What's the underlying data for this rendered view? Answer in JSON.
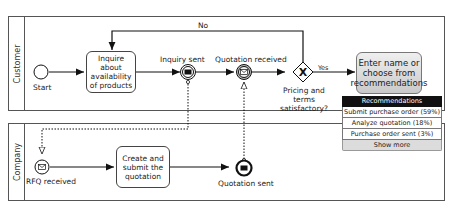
{
  "pools": {
    "customer": {
      "label": "Customer"
    },
    "company": {
      "label": "Company"
    }
  },
  "customer": {
    "start_label": "Start",
    "task_inquire": "Inquire about availability of products",
    "event_inquiry_sent": "Inquiry sent",
    "event_quotation_received": "Quotation received",
    "gateway_label": "Pricing and terms satisfactory?",
    "gateway_no": "No",
    "gateway_yes": "Yes",
    "ghost_task": "Enter name or choose from recommendations"
  },
  "company": {
    "event_rfq_received": "RFQ received",
    "task_create": "Create and submit the quotation",
    "event_quotation_sent": "Quotation sent"
  },
  "recommendations": {
    "header": "Recommendations",
    "items": [
      {
        "label": "Submit purchase order (59%)"
      },
      {
        "label": "Analyze quotation (18%)"
      },
      {
        "label": "Purchase order sent (3%)"
      }
    ],
    "show_more": "Show more"
  }
}
